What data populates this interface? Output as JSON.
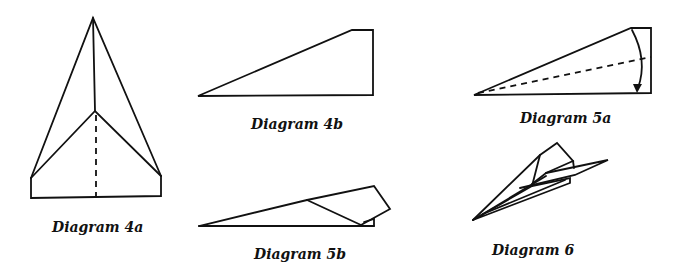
{
  "diagrams": [
    {
      "id": "4a",
      "label": "Diagram 4a"
    },
    {
      "id": "4b",
      "label": "Diagram 4b"
    },
    {
      "id": "5a",
      "label": "Diagram 5a"
    },
    {
      "id": "5b",
      "label": "Diagram 5b"
    },
    {
      "id": "6",
      "label": "Diagram 6"
    }
  ],
  "colors": {
    "ink": "#111111",
    "background": "#ffffff"
  }
}
